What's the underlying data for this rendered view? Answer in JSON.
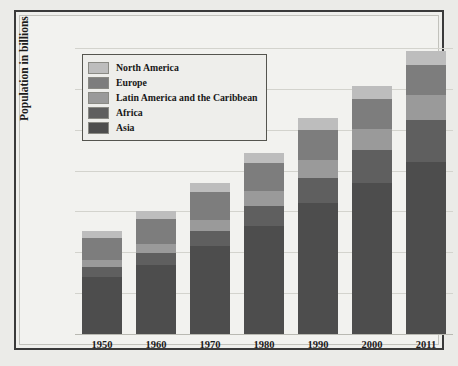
{
  "chart_data": {
    "type": "bar",
    "stacked": true,
    "title": "",
    "xlabel": "",
    "ylabel": "Population in billions",
    "categories": [
      "1950",
      "1960",
      "1970",
      "1980",
      "1990",
      "2000",
      "2011"
    ],
    "ylim": [
      0,
      7
    ],
    "yticks": [
      "7",
      "6",
      "5",
      "4",
      "3",
      "2",
      "1",
      "0"
    ],
    "ytick_values": [
      7,
      6,
      5,
      4,
      3,
      2,
      1,
      0
    ],
    "grid": true,
    "legend_position": "top-left",
    "stack_order_bottom_to_top": [
      "Asia",
      "Africa",
      "Latin America and the Caribbean",
      "Europe",
      "North America"
    ],
    "series": [
      {
        "name": "Asia",
        "color": "#4d4d4d",
        "values": [
          1.4,
          1.7,
          2.15,
          2.65,
          3.2,
          3.7,
          4.2
        ]
      },
      {
        "name": "Africa",
        "color": "#5f5f5f",
        "values": [
          0.23,
          0.29,
          0.37,
          0.48,
          0.63,
          0.81,
          1.05
        ]
      },
      {
        "name": "Latin America and the Caribbean",
        "color": "#9a9a9a",
        "values": [
          0.17,
          0.22,
          0.28,
          0.36,
          0.44,
          0.52,
          0.6
        ]
      },
      {
        "name": "Europe",
        "color": "#7d7d7d",
        "values": [
          0.55,
          0.6,
          0.67,
          0.69,
          0.73,
          0.73,
          0.74
        ]
      },
      {
        "name": "North America",
        "color": "#bdbdbd",
        "values": [
          0.17,
          0.2,
          0.23,
          0.26,
          0.28,
          0.31,
          0.33
        ]
      }
    ],
    "totals": [
      2.52,
      3.01,
      3.7,
      4.44,
      5.28,
      6.07,
      6.92
    ]
  },
  "legend": {
    "items": [
      {
        "label": "North America",
        "color": "#bdbdbd"
      },
      {
        "label": "Europe",
        "color": "#7d7d7d"
      },
      {
        "label": "Latin America and the Caribbean",
        "color": "#9a9a9a"
      },
      {
        "label": "Africa",
        "color": "#5f5f5f"
      },
      {
        "label": "Asia",
        "color": "#4d4d4d"
      }
    ]
  },
  "colors": {
    "page_background": "#ebebe8",
    "plot_background": "#f2f2ef",
    "frame_border": "#3a3a3a",
    "gridline": "#d3d3cd",
    "text": "#1c1c1c"
  }
}
